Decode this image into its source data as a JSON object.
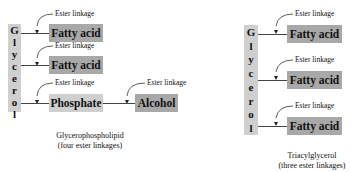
{
  "left": {
    "glycerol_letters": [
      "G",
      "l",
      "y",
      "c",
      "e",
      "r",
      "o",
      "l"
    ],
    "boxes": [
      "Fatty acid",
      "Fatty acid",
      "Phosphate",
      "Alcohol"
    ],
    "linkage_label": "Ester linkage",
    "caption_line1": "Glycerophospholipid",
    "caption_line2": "(four ester linkages)"
  },
  "right": {
    "glycerol_letters": [
      "G",
      "l",
      "y",
      "c",
      "e",
      "r",
      "o",
      "l"
    ],
    "boxes": [
      "Fatty acid",
      "Fatty acid",
      "Fatty acid"
    ],
    "linkage_label": "Ester linkage",
    "caption_line1": "Triacylglycerol",
    "caption_line2": "(three ester linkages)"
  },
  "colors": {
    "dark_box": "#a8a8a8",
    "light_box": "#cfcfcf"
  }
}
